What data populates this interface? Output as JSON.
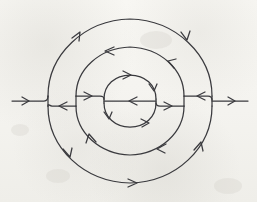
{
  "figure": {
    "title": "Concentric arc flow diagram",
    "description": "Three nested circular arc systems split along a central horizontal axis, with directional arrowheads, plus a straight entry line on the left and exit line on the right.",
    "medium": "pencil sketch on off-white paper",
    "ink_color": "#3a3a3e",
    "paper_color": "#f6f5f1",
    "center": {
      "x": 130,
      "y": 101
    },
    "axis_y": 101,
    "upper_axis_y": 96,
    "lower_axis_y": 106,
    "rings": [
      {
        "name": "outer-ring",
        "radius": 82,
        "top_y": 19,
        "bottom_y": 183,
        "left_x": 48,
        "right_x": 212,
        "upper_direction": "clockwise",
        "lower_direction": "clockwise"
      },
      {
        "name": "middle-ring",
        "radius": 54,
        "top_y": 47,
        "bottom_y": 155,
        "left_x": 76,
        "right_x": 184,
        "upper_direction": "counterclockwise",
        "lower_direction": "counterclockwise"
      },
      {
        "name": "inner-ring",
        "radius": 26,
        "top_y": 75,
        "bottom_y": 127,
        "left_x": 104,
        "right_x": 156,
        "upper_direction": "clockwise",
        "lower_direction": "clockwise"
      }
    ],
    "entry_line": {
      "name": "left-entry-line",
      "from_x": 12,
      "to_x": 48,
      "y": 101,
      "direction": "rightward"
    },
    "exit_line": {
      "name": "right-exit-line",
      "from_x": 212,
      "to_x": 248,
      "y": 101,
      "direction": "rightward"
    },
    "axis_segments": [
      {
        "name": "axis-segment-outer-left",
        "from_x": 48,
        "to_x": 76,
        "y": 106,
        "direction": "leftward"
      },
      {
        "name": "axis-segment-middle-left",
        "from_x": 76,
        "to_x": 104,
        "y": 96,
        "direction": "rightward"
      },
      {
        "name": "axis-segment-inner-left",
        "from_x": 104,
        "to_x": 156,
        "y": 101,
        "direction": "leftward"
      },
      {
        "name": "axis-segment-middle-right",
        "from_x": 156,
        "to_x": 184,
        "y": 106,
        "direction": "rightward"
      },
      {
        "name": "axis-segment-outer-right",
        "from_x": 184,
        "to_x": 212,
        "y": 96,
        "direction": "leftward"
      }
    ],
    "arrowheads": [
      {
        "name": "arrowhead-entry-left",
        "x": 28,
        "y": 101,
        "angle": 0,
        "on": "left-entry-line"
      },
      {
        "name": "arrowhead-exit-right",
        "x": 234,
        "y": 101,
        "angle": 0,
        "on": "right-exit-line"
      },
      {
        "name": "arrowhead-outer-upper-left",
        "x": 79,
        "y": 33,
        "angle": -58,
        "on": "outer-ring-upper"
      },
      {
        "name": "arrowhead-outer-upper-right",
        "x": 186,
        "y": 38,
        "angle": 56,
        "on": "outer-ring-upper"
      },
      {
        "name": "arrowhead-outer-lower-left",
        "x": 70,
        "y": 155,
        "angle": 112,
        "on": "outer-ring-lower"
      },
      {
        "name": "arrowhead-outer-lower-bottom",
        "x": 135,
        "y": 183,
        "angle": 4,
        "on": "outer-ring-lower"
      },
      {
        "name": "arrowhead-outer-lower-right",
        "x": 200,
        "y": 144,
        "angle": -58,
        "on": "outer-ring-lower"
      },
      {
        "name": "arrowhead-middle-upper-top",
        "x": 107,
        "y": 51,
        "angle": 190,
        "on": "middle-ring-upper"
      },
      {
        "name": "arrowhead-middle-upper-right",
        "x": 169,
        "y": 63,
        "angle": -124,
        "on": "middle-ring-upper"
      },
      {
        "name": "arrowhead-middle-lower-left",
        "x": 90,
        "y": 136,
        "angle": -59,
        "on": "middle-ring-lower"
      },
      {
        "name": "arrowhead-middle-lower-right",
        "x": 158,
        "y": 148,
        "angle": 150,
        "on": "middle-ring-lower"
      },
      {
        "name": "arrowhead-inner-upper-top",
        "x": 129,
        "y": 75,
        "angle": -2,
        "on": "inner-ring-upper"
      },
      {
        "name": "arrowhead-inner-upper-right",
        "x": 153,
        "y": 89,
        "angle": 58,
        "on": "inner-ring-upper"
      },
      {
        "name": "arrowhead-inner-lower-left",
        "x": 109,
        "y": 117,
        "angle": 118,
        "on": "inner-ring-lower"
      },
      {
        "name": "arrowhead-inner-lower-right",
        "x": 147,
        "y": 122,
        "angle": -20,
        "on": "inner-ring-lower"
      },
      {
        "name": "arrowhead-axis-outer-left",
        "x": 60,
        "y": 106,
        "angle": 180,
        "on": "axis-segment-outer-left"
      },
      {
        "name": "arrowhead-axis-middle-left",
        "x": 90,
        "y": 96,
        "angle": 0,
        "on": "axis-segment-middle-left"
      },
      {
        "name": "arrowhead-axis-inner",
        "x": 130,
        "y": 101,
        "angle": 180,
        "on": "axis-segment-inner-left"
      },
      {
        "name": "arrowhead-axis-middle-right",
        "x": 170,
        "y": 106,
        "angle": 0,
        "on": "axis-segment-middle-right"
      },
      {
        "name": "arrowhead-axis-outer-right",
        "x": 198,
        "y": 96,
        "angle": 180,
        "on": "axis-segment-outer-right"
      }
    ]
  }
}
